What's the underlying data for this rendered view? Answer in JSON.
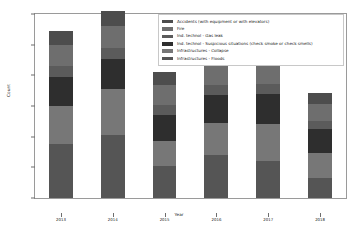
{
  "chart_data": {
    "type": "bar",
    "subtype": "stacked-bar",
    "title": "",
    "xlabel": "Year",
    "ylabel": "Count",
    "categories": [
      "2013",
      "2014",
      "2015",
      "2016",
      "2017",
      "2018"
    ],
    "ylim": [
      0,
      3000
    ],
    "yticks": [
      0,
      500,
      1000,
      1500,
      2000,
      2500,
      3000
    ],
    "ytick_labels": [
      "0",
      "500",
      "1000",
      "1500",
      "2000",
      "2500",
      "3000"
    ],
    "grid": false,
    "legend_position": "top-right",
    "series": [
      {
        "name": "Accidents (with equipment or with elevators)",
        "color": "#4d4d4d",
        "values": [
          230,
          245,
          215,
          230,
          240,
          190
        ]
      },
      {
        "name": "Fire",
        "color": "#6e6e6e",
        "values": [
          345,
          350,
          315,
          330,
          345,
          270
        ]
      },
      {
        "name": "Ind. technol - Gas leak",
        "color": "#5b5b5b",
        "values": [
          175,
          180,
          160,
          170,
          175,
          140
        ]
      },
      {
        "name": "Ind. technol - Suspicious situations (check smoke or check smells)",
        "color": "#2e2e2e",
        "values": [
          470,
          490,
          430,
          455,
          480,
          380
        ]
      },
      {
        "name": "Infrastructures - Collapse",
        "color": "#777777",
        "values": [
          620,
          760,
          400,
          520,
          610,
          420
        ]
      },
      {
        "name": "Infrastructures - Floods",
        "color": "#555555",
        "values": [
          880,
          1020,
          530,
          700,
          600,
          320
        ]
      }
    ],
    "totals": [
      2720,
      3045,
      2050,
      2405,
      2450,
      1720
    ]
  },
  "legend": {
    "items": [
      {
        "label": "Accidents (with equipment or with elevators)"
      },
      {
        "label": "Fire"
      },
      {
        "label": "Ind. technol - Gas leak"
      },
      {
        "label": "Ind. technol - Suspicious situations (check smoke or check smells)"
      },
      {
        "label": "Infrastructures - Collapse"
      },
      {
        "label": "Infrastructures - Floods"
      }
    ]
  }
}
